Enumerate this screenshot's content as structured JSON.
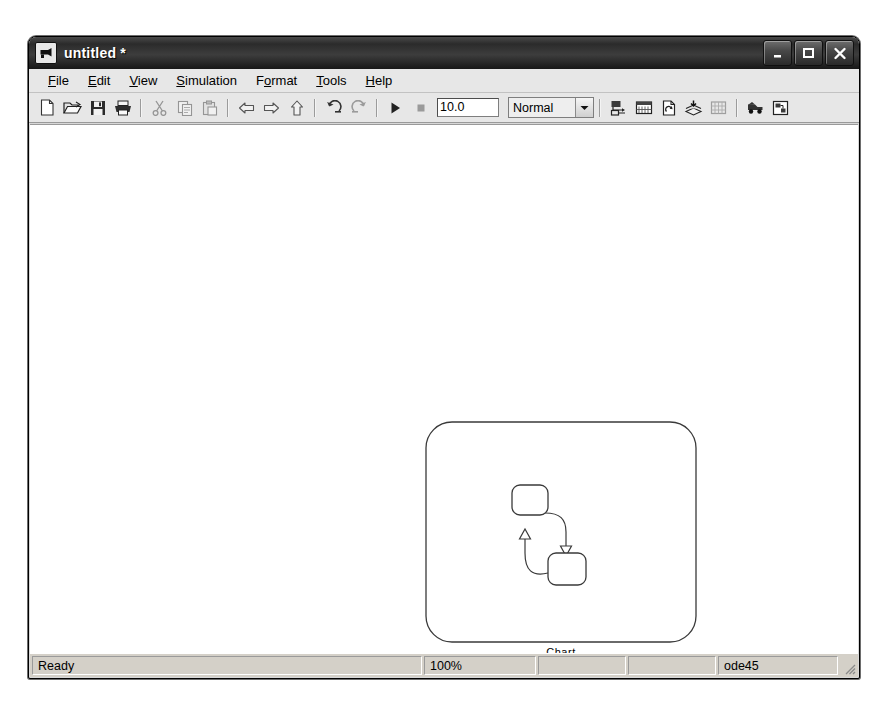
{
  "window": {
    "title": "untitled *",
    "icon": "simulink-model-icon",
    "caption_buttons": [
      {
        "name": "minimize-button",
        "glyph": "minimize-icon"
      },
      {
        "name": "maximize-button",
        "glyph": "maximize-icon"
      },
      {
        "name": "close-button",
        "glyph": "close-icon"
      }
    ]
  },
  "menubar": {
    "items": [
      {
        "label": "File",
        "accel": "F"
      },
      {
        "label": "Edit",
        "accel": "E"
      },
      {
        "label": "View",
        "accel": "V"
      },
      {
        "label": "Simulation",
        "accel": "S"
      },
      {
        "label": "Format",
        "accel": "o"
      },
      {
        "label": "Tools",
        "accel": "T"
      },
      {
        "label": "Help",
        "accel": "H"
      }
    ]
  },
  "toolbar": {
    "buttons": [
      {
        "name": "new-model-button",
        "icon": "new-document-icon",
        "enabled": true
      },
      {
        "name": "open-model-button",
        "icon": "open-folder-icon",
        "enabled": true
      },
      {
        "name": "save-model-button",
        "icon": "floppy-disk-icon",
        "enabled": true
      },
      {
        "name": "print-button",
        "icon": "printer-icon",
        "enabled": true
      },
      {
        "name": "cut-button",
        "icon": "scissors-icon",
        "enabled": false
      },
      {
        "name": "copy-button",
        "icon": "copy-pages-icon",
        "enabled": false
      },
      {
        "name": "paste-button",
        "icon": "clipboard-paste-icon",
        "enabled": false
      },
      {
        "name": "back-button",
        "icon": "arrow-left-icon",
        "enabled": true
      },
      {
        "name": "forward-button",
        "icon": "arrow-right-icon",
        "enabled": true
      },
      {
        "name": "up-level-button",
        "icon": "arrow-up-icon",
        "enabled": true
      },
      {
        "name": "undo-button",
        "icon": "undo-arrow-icon",
        "enabled": true
      },
      {
        "name": "redo-button",
        "icon": "redo-arrow-icon",
        "enabled": false
      },
      {
        "name": "start-simulation-button",
        "icon": "play-triangle-icon",
        "enabled": true
      },
      {
        "name": "stop-simulation-button",
        "icon": "stop-square-icon",
        "enabled": false
      },
      {
        "name": "library-browser-button",
        "icon": "library-browser-icon",
        "enabled": true
      },
      {
        "name": "model-explorer-button",
        "icon": "model-explorer-icon",
        "enabled": true
      },
      {
        "name": "update-diagram-button",
        "icon": "update-diagram-icon",
        "enabled": true
      },
      {
        "name": "build-model-button",
        "icon": "build-layers-icon",
        "enabled": true
      },
      {
        "name": "toggle-grid-button",
        "icon": "grid-icon",
        "enabled": false
      },
      {
        "name": "debug-button",
        "icon": "debug-truck-icon",
        "enabled": true
      },
      {
        "name": "model-parameters-button",
        "icon": "model-properties-icon",
        "enabled": true
      }
    ],
    "stop_time": "10.0",
    "simulation_mode": "Normal",
    "mode_dropdown_icon": "chevron-down-icon"
  },
  "canvas": {
    "blocks": [
      {
        "name": "stateflow-chart-block",
        "label": "Chart",
        "type": "stateflow-chart",
        "states": [
          {
            "name": "state-a",
            "label": ""
          },
          {
            "name": "state-b",
            "label": ""
          }
        ],
        "transitions": [
          {
            "from": "state-a",
            "to": "state-b"
          },
          {
            "from": "state-b",
            "to": "state-a"
          }
        ]
      }
    ]
  },
  "statusbar": {
    "status": "Ready",
    "zoom": "100%",
    "panel_3": "",
    "panel_4": "",
    "solver": "ode45",
    "grip_icon": "resize-grip-icon"
  }
}
